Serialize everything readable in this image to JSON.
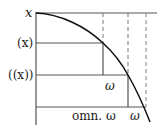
{
  "diagram": {
    "labels": {
      "y_top": "x",
      "y_mid": "(x)",
      "y_low": "((x))",
      "omega_inner": "ω",
      "x_axis_left": "omn. ω",
      "x_axis_right": "ω"
    },
    "colors": {
      "axis": "#555555",
      "curve": "#111111",
      "dashed": "#777777",
      "text": "#1a1a1a",
      "background": "#ffffff"
    }
  }
}
